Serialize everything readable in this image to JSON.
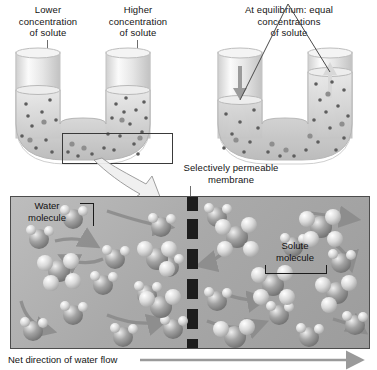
{
  "figure": {
    "title_alt": "Osmosis across a selectively permeable membrane",
    "labels": {
      "lower_concentration": "Lower\nconcentration\nof solute",
      "higher_concentration": "Higher\nconcentration\nof solute",
      "equilibrium": "At equilibrium: equal\nconcentrations\nof solute",
      "membrane": "Selectively permeable\nmembrane",
      "water_molecule": "Water\nmolecule",
      "solute_molecule": "Solute\nmolecule",
      "net_flow": "Net direction of water flow"
    }
  },
  "panels": {
    "left_tube": {
      "name": "starting-condition-u-tube",
      "left_arm_label": "Lower concentration of solute",
      "right_arm_label": "Higher concentration of solute",
      "callout_box": "magnified-region"
    },
    "right_tube": {
      "name": "equilibrium-u-tube",
      "left_arm_arrow": "down",
      "right_arm_arrow": "up",
      "state": "At equilibrium: equal concentrations of solute"
    },
    "magnified": {
      "name": "membrane-closeup",
      "left_side": "water molecules, few solute clusters",
      "right_side": "water molecules, many solute clusters",
      "membrane": "dashed vertical selectively permeable membrane",
      "flow_direction": "left to right"
    }
  },
  "colors": {
    "ink": "#141414",
    "leader": "#6d6d6d",
    "panel_light": "#bdbdbd",
    "panel_dark": "#9c9c9c",
    "membrane": "#1d1d1d",
    "arrow": "#8a8a8a",
    "water_sphere": "#8f8f8f",
    "solute_sphere": "#d7d7d7",
    "glass": "#dcdcdc"
  }
}
